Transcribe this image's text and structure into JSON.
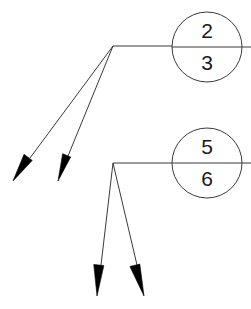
{
  "figure": {
    "width": 251,
    "height": 309,
    "background_color": "#ffffff",
    "stroke_color": "#3a3a3a",
    "arrow_fill_color": "#000000",
    "text_color": "#1a1a1a"
  },
  "nodes": [
    {
      "id": "node-top",
      "name": "circle-node-2-3",
      "cx": 207,
      "cy": 47,
      "r": 35,
      "upper_label": "2",
      "lower_label": "3",
      "upper_label_x": 207,
      "upper_label_y": 32,
      "lower_label_x": 207,
      "lower_label_y": 64
    },
    {
      "id": "node-bottom",
      "name": "circle-node-5-6",
      "cx": 207,
      "cy": 163,
      "r": 35,
      "upper_label": "5",
      "lower_label": "6",
      "upper_label_x": 207,
      "upper_label_y": 148,
      "lower_label_x": 207,
      "lower_label_y": 180
    }
  ],
  "divider_lines": [
    {
      "name": "divider-line-top",
      "x1": 172,
      "y1": 47,
      "x2": 251,
      "y2": 47
    },
    {
      "name": "divider-line-bottom",
      "x1": 172,
      "y1": 163,
      "x2": 251,
      "y2": 163
    }
  ],
  "leader_lines": [
    {
      "name": "leader-line-top",
      "x1": 113,
      "y1": 46,
      "x2": 174,
      "y2": 46
    },
    {
      "name": "leader-line-bottom",
      "x1": 113,
      "y1": 163,
      "x2": 174,
      "y2": 163
    }
  ],
  "junctions": [
    {
      "name": "junction-top",
      "x": 113,
      "y": 46
    },
    {
      "name": "junction-bottom",
      "x": 113,
      "y": 163
    }
  ],
  "arrows": [
    {
      "name": "arrow-upper-left",
      "group": "top",
      "tail_x": 113,
      "tail_y": 46,
      "tip_x": 13,
      "tip_y": 181,
      "shaft_end_x": 30,
      "shaft_end_y": 158,
      "head_length": 28,
      "head_half_width": 7
    },
    {
      "name": "arrow-upper-right",
      "group": "top",
      "tail_x": 113,
      "tail_y": 46,
      "tip_x": 58,
      "tip_y": 181,
      "shaft_end_x": 68,
      "shaft_end_y": 156,
      "head_length": 27,
      "head_half_width": 6
    },
    {
      "name": "arrow-lower-left",
      "group": "bottom",
      "tail_x": 113,
      "tail_y": 163,
      "tip_x": 97,
      "tip_y": 296,
      "shaft_end_x": 101,
      "shaft_end_y": 265,
      "head_length": 31,
      "head_half_width": 7
    },
    {
      "name": "arrow-lower-right",
      "group": "bottom",
      "tail_x": 113,
      "tail_y": 163,
      "tip_x": 144,
      "tip_y": 296,
      "shaft_end_x": 137,
      "shaft_end_y": 265,
      "head_length": 32,
      "head_half_width": 7
    }
  ],
  "caption": {
    "name": "figure-caption",
    "text": "",
    "x": 125,
    "y": 306,
    "visible": false
  }
}
